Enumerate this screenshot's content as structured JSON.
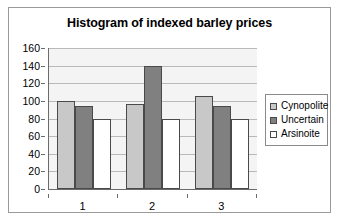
{
  "chart_data": {
    "type": "bar",
    "title": "Histogram of indexed barley prices",
    "xlabel": "",
    "ylabel": "",
    "categories": [
      "1",
      "2",
      "3"
    ],
    "series": [
      {
        "name": "Cynopolite",
        "color": "#c8c8c8",
        "values": [
          100,
          97,
          105
        ]
      },
      {
        "name": "Uncertain",
        "color": "#808080",
        "values": [
          94,
          140,
          94
        ]
      },
      {
        "name": "Arsinoite",
        "color": "#ffffff",
        "values": [
          79,
          79,
          79
        ]
      }
    ],
    "ylim": [
      0,
      160
    ],
    "ytick_step": 20,
    "yticks": [
      0,
      20,
      40,
      60,
      80,
      100,
      120,
      140,
      160
    ],
    "grid": true,
    "legend_position": "right",
    "plot_background": "#f4f4f4",
    "gridline_color": "#b9b9b9",
    "axis_color": "#6b6b6b",
    "bar_border_color": "#4a4a4a"
  }
}
